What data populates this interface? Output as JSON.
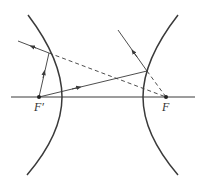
{
  "diagram": {
    "type": "hyperbola-reflection",
    "labels": {
      "left_focus": "F′",
      "right_focus": "F"
    },
    "colors": {
      "stroke": "#3a3a3a",
      "background": "#ffffff"
    },
    "elements": [
      "axis",
      "left-branch",
      "right-branch",
      "ray-focus-to-left-branch",
      "ray-focus-to-right-branch",
      "reflected-ray-left",
      "reflected-ray-right",
      "dashed-extension-left",
      "dashed-extension-right"
    ]
  }
}
